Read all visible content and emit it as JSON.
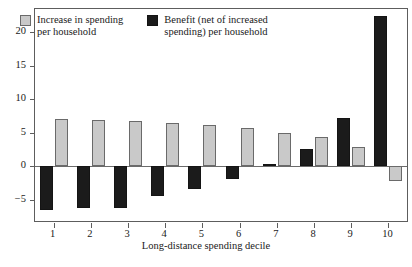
{
  "chart_data": {
    "type": "bar",
    "title": "",
    "xlabel": "Long-distance spending decile",
    "ylabel": "",
    "categories": [
      "1",
      "2",
      "3",
      "4",
      "5",
      "6",
      "7",
      "8",
      "9",
      "10"
    ],
    "yticks": [
      -5,
      0,
      5,
      10,
      15,
      20
    ],
    "ytick_labels": [
      "−5",
      "0",
      "5",
      "10",
      "15",
      "20"
    ],
    "ylim": [
      -8.2,
      23.5
    ],
    "grid": false,
    "legend_position": "top-left",
    "series": [
      {
        "name": "Benefit (net of increased\nspending) per household",
        "color": "#1b1b1b",
        "values": [
          -6.5,
          -6.2,
          -6.3,
          -4.4,
          -3.4,
          -1.9,
          0.3,
          2.5,
          7.2,
          22.5
        ]
      },
      {
        "name": "Increase in spending\nper household",
        "color": "#c9c9c9",
        "values": [
          7.0,
          6.9,
          6.8,
          6.4,
          6.1,
          5.7,
          5.0,
          4.3,
          2.8,
          -2.2
        ]
      }
    ]
  },
  "legend": {
    "entries": [
      {
        "label": "Increase in spending\nper household",
        "swatch": "spending"
      },
      {
        "label": "Benefit (net of increased\nspending) per household",
        "swatch": "benefit"
      }
    ]
  },
  "axis": {
    "x_title": "Long-distance spending decile"
  }
}
